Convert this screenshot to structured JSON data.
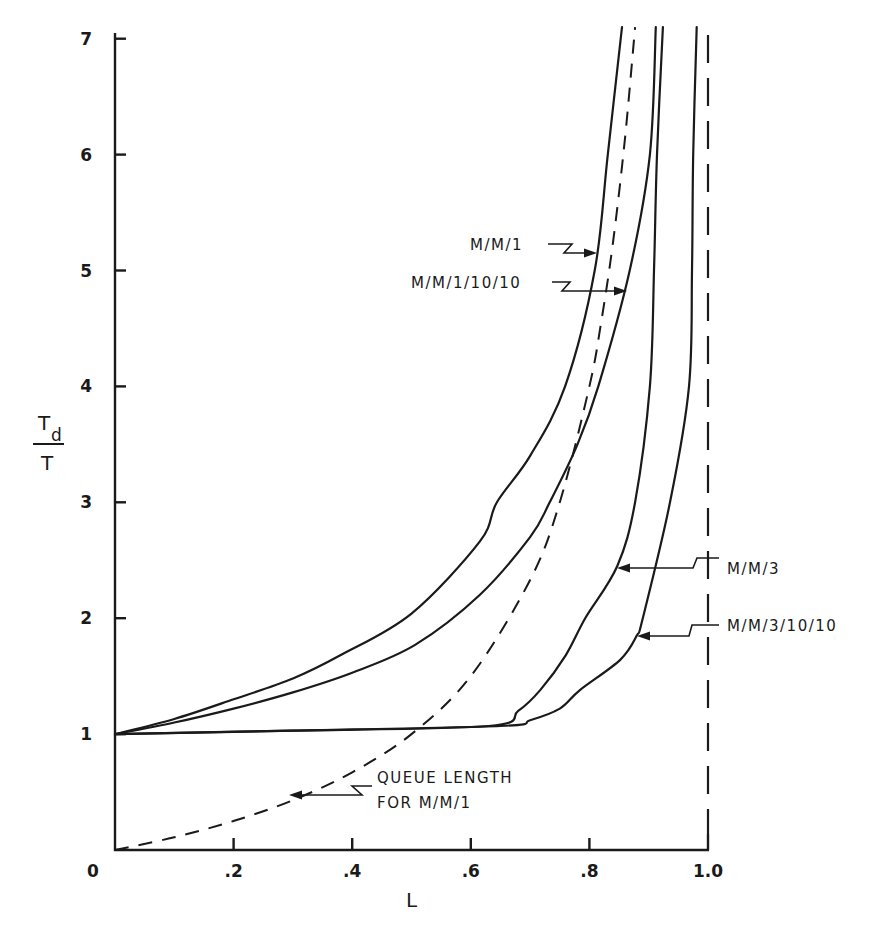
{
  "chart_data": {
    "type": "line",
    "title": "",
    "xlabel": "L",
    "ylabel": "Td / T",
    "ylabel_numerator": "T",
    "ylabel_subscript": "d",
    "ylabel_denominator": "T",
    "xlim": [
      0,
      1.0
    ],
    "ylim": [
      0,
      7.1
    ],
    "grid": false,
    "legend_position": "inline annotations with arrows",
    "x_ticks": [
      0,
      0.2,
      0.4,
      0.6,
      0.8,
      1.0
    ],
    "x_tick_labels": [
      "0",
      ".2",
      ".4",
      ".6",
      ".8",
      "1.0"
    ],
    "y_ticks": [
      1,
      2,
      3,
      4,
      5,
      6,
      7
    ],
    "y_tick_labels": [
      "1",
      "2",
      "3",
      "4",
      "5",
      "6",
      "7"
    ],
    "reference_lines": [
      {
        "type": "vertical",
        "x": 1.0,
        "style": "dashed"
      }
    ],
    "series": [
      {
        "name": "M/M/1",
        "style": "solid",
        "x": [
          0,
          0.1,
          0.2,
          0.3,
          0.38,
          0.5,
          0.615,
          0.644,
          0.7,
          0.759,
          0.809,
          0.831,
          0.855
        ],
        "y": [
          1,
          1.13,
          1.3,
          1.48,
          1.68,
          2.04,
          2.66,
          3.0,
          3.4,
          4.0,
          5.0,
          6.0,
          7.1
        ],
        "label_pos": {
          "x": 0.81,
          "y": 5.2
        }
      },
      {
        "name": "M/M/1/10/10",
        "style": "solid",
        "x": [
          0,
          0.1,
          0.2,
          0.3,
          0.4,
          0.506,
          0.615,
          0.7,
          0.733,
          0.78,
          0.815,
          0.868,
          0.902,
          0.912
        ],
        "y": [
          1,
          1.1,
          1.22,
          1.36,
          1.53,
          1.77,
          2.2,
          2.7,
          3.0,
          3.5,
          4.0,
          5.0,
          6.0,
          7.1
        ],
        "label_pos": {
          "x": 0.86,
          "y": 4.85
        }
      },
      {
        "name": "M/M/3",
        "style": "solid",
        "x": [
          0,
          0.3,
          0.63,
          0.68,
          0.717,
          0.76,
          0.793,
          0.847,
          0.877,
          0.902,
          0.909,
          0.914,
          0.924
        ],
        "y": [
          1,
          1.03,
          1.07,
          1.2,
          1.38,
          1.68,
          2.0,
          2.45,
          3.0,
          4.0,
          5.0,
          6.0,
          7.1
        ],
        "label_pos": {
          "x": 0.847,
          "y": 2.45
        }
      },
      {
        "name": "M/M/3/10/10",
        "style": "solid",
        "x": [
          0,
          0.3,
          0.65,
          0.7,
          0.75,
          0.784,
          0.852,
          0.88,
          0.89,
          0.936,
          0.968,
          0.973,
          0.975,
          0.981
        ],
        "y": [
          1,
          1.03,
          1.07,
          1.12,
          1.22,
          1.38,
          1.64,
          1.85,
          2.0,
          3.0,
          4.0,
          5.0,
          6.0,
          7.1
        ],
        "label_pos": {
          "x": 0.88,
          "y": 1.85
        }
      },
      {
        "name": "QUEUE LENGTH FOR M/M/1",
        "style": "dashed",
        "formula": "L/(1-L)",
        "x": [
          0,
          0.1,
          0.2,
          0.3,
          0.4,
          0.5,
          0.6,
          0.7,
          0.75,
          0.8,
          0.82,
          0.84,
          0.86,
          0.877
        ],
        "y": [
          0,
          0.11,
          0.25,
          0.43,
          0.67,
          1.0,
          1.5,
          2.33,
          3.0,
          4.0,
          4.56,
          5.25,
          6.14,
          7.1
        ],
        "label_pos": {
          "x": 0.3,
          "y": 0.47
        }
      }
    ]
  },
  "annotations": {
    "mm1": "M/M/1",
    "mm1_10_10": "M/M/1/10/10",
    "mm3": "M/M/3",
    "mm3_10_10": "M/M/3/10/10",
    "queue_line1": "QUEUE LENGTH",
    "queue_line2": "FOR M/M/1"
  },
  "axes": {
    "x_title": "L",
    "y_title_num": "T",
    "y_title_sub": "d",
    "y_title_den": "T"
  }
}
